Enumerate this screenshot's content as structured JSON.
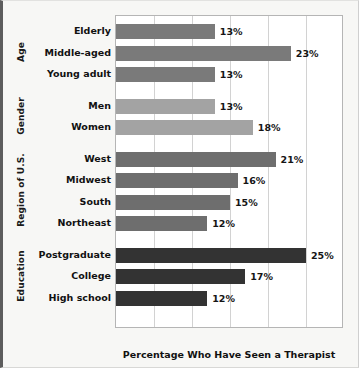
{
  "chart_data": {
    "type": "bar",
    "orientation": "horizontal",
    "title": "",
    "xlabel": "Percentage Who Have Seen a Therapist",
    "ylabel": "",
    "xlim": [
      0,
      30
    ],
    "grid": true,
    "gridline_step": 5,
    "legend": "none",
    "value_suffix": "%",
    "groups": [
      {
        "name": "Age",
        "color": "#7a7a7a",
        "categories": [
          "Elderly",
          "Middle-aged",
          "Young adult"
        ],
        "values": [
          13,
          23,
          13
        ],
        "labels": [
          "13%",
          "23%",
          "13%"
        ]
      },
      {
        "name": "Gender",
        "color": "#a3a3a3",
        "categories": [
          "Men",
          "Women"
        ],
        "values": [
          13,
          18
        ],
        "labels": [
          "13%",
          "18%"
        ]
      },
      {
        "name": "Region of U.S.",
        "color": "#6e6e6e",
        "categories": [
          "West",
          "Midwest",
          "South",
          "Northeast"
        ],
        "values": [
          21,
          16,
          15,
          12
        ],
        "labels": [
          "21%",
          "16%",
          "15%",
          "12%"
        ]
      },
      {
        "name": "Education",
        "color": "#333333",
        "categories": [
          "Postgraduate",
          "College",
          "High school"
        ],
        "values": [
          25,
          17,
          12
        ],
        "labels": [
          "25%",
          "17%",
          "12%"
        ]
      }
    ]
  },
  "axis": {
    "title": "Percentage Who Have Seen a Therapist"
  },
  "colors": {
    "plot_background": "#ffffff",
    "page_background": "#f7f7f5",
    "gridline": "#d2d2d2",
    "plot_border": "#b5b5b5",
    "text": "#111111"
  }
}
